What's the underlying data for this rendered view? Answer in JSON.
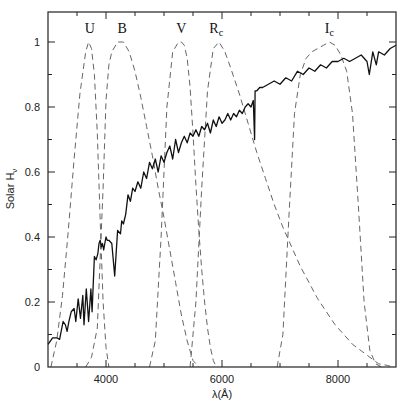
{
  "chart_data": {
    "type": "line",
    "title": "",
    "xlabel": "λ(Å)",
    "ylabel": "Solar H_ν",
    "xlim": [
      3000,
      9000
    ],
    "ylim": [
      0,
      1.1
    ],
    "grid": false,
    "legend": "none (bands labelled above peaks)",
    "x_ticks": [
      4000,
      6000,
      8000
    ],
    "x_minor_step": 500,
    "y_ticks": [
      0,
      0.2,
      0.4,
      0.6,
      0.8,
      1
    ],
    "y_tick_labels": [
      "0",
      "0.2",
      "0.4",
      "0.6",
      "0.8",
      "1"
    ],
    "y_minor_step": 0.1,
    "series": [
      {
        "name": "Solar H_ν",
        "style": "solid",
        "x": [
          3000,
          3080,
          3150,
          3200,
          3260,
          3300,
          3330,
          3360,
          3400,
          3450,
          3480,
          3520,
          3560,
          3600,
          3620,
          3660,
          3700,
          3740,
          3760,
          3800,
          3830,
          3860,
          3880,
          3900,
          3920,
          3940,
          3960,
          3980,
          4000,
          4020,
          4050,
          4100,
          4150,
          4200,
          4250,
          4270,
          4300,
          4340,
          4380,
          4420,
          4460,
          4500,
          4550,
          4600,
          4650,
          4700,
          4750,
          4800,
          4850,
          4900,
          4950,
          5000,
          5050,
          5100,
          5150,
          5200,
          5250,
          5300,
          5350,
          5400,
          5450,
          5500,
          5550,
          5600,
          5650,
          5700,
          5750,
          5800,
          5850,
          5900,
          5950,
          6000,
          6050,
          6100,
          6150,
          6200,
          6250,
          6300,
          6350,
          6400,
          6450,
          6500,
          6540,
          6562,
          6570,
          6600,
          6650,
          6700,
          6800,
          6900,
          7000,
          7100,
          7200,
          7300,
          7400,
          7500,
          7600,
          7700,
          7800,
          7900,
          8000,
          8100,
          8200,
          8300,
          8400,
          8500,
          8540,
          8600,
          8660,
          8700,
          8800,
          8900,
          9000
        ],
        "values": [
          0.07,
          0.09,
          0.09,
          0.085,
          0.14,
          0.13,
          0.11,
          0.14,
          0.17,
          0.18,
          0.14,
          0.21,
          0.15,
          0.22,
          0.13,
          0.24,
          0.14,
          0.24,
          0.17,
          0.34,
          0.33,
          0.35,
          0.38,
          0.39,
          0.37,
          0.38,
          0.36,
          0.38,
          0.4,
          0.39,
          0.39,
          0.38,
          0.28,
          0.42,
          0.41,
          0.45,
          0.44,
          0.47,
          0.53,
          0.51,
          0.55,
          0.54,
          0.57,
          0.55,
          0.6,
          0.58,
          0.63,
          0.61,
          0.64,
          0.6,
          0.65,
          0.63,
          0.66,
          0.68,
          0.64,
          0.7,
          0.66,
          0.69,
          0.71,
          0.69,
          0.72,
          0.71,
          0.73,
          0.71,
          0.74,
          0.73,
          0.75,
          0.72,
          0.76,
          0.74,
          0.77,
          0.75,
          0.76,
          0.78,
          0.76,
          0.78,
          0.77,
          0.79,
          0.78,
          0.8,
          0.81,
          0.8,
          0.82,
          0.7,
          0.85,
          0.85,
          0.86,
          0.86,
          0.87,
          0.88,
          0.87,
          0.89,
          0.88,
          0.91,
          0.9,
          0.92,
          0.91,
          0.93,
          0.92,
          0.94,
          0.94,
          0.95,
          0.94,
          0.95,
          0.96,
          0.94,
          0.9,
          0.97,
          0.93,
          0.97,
          0.96,
          0.98,
          0.99
        ]
      },
      {
        "name": "U",
        "style": "dashed",
        "x": [
          3050,
          3150,
          3250,
          3350,
          3450,
          3550,
          3650,
          3700,
          3750,
          3800,
          3850,
          3900,
          3950,
          4000,
          4050
        ],
        "values": [
          0.0,
          0.08,
          0.22,
          0.42,
          0.64,
          0.84,
          0.97,
          1.0,
          0.98,
          0.9,
          0.72,
          0.45,
          0.2,
          0.06,
          0.0
        ]
      },
      {
        "name": "B",
        "style": "dashed",
        "x": [
          3650,
          3750,
          3850,
          3950,
          4000,
          4050,
          4100,
          4200,
          4300,
          4400,
          4500,
          4600,
          4700,
          4800,
          4900,
          5000,
          5100,
          5200,
          5300,
          5400,
          5500,
          5600
        ],
        "values": [
          0.0,
          0.03,
          0.12,
          0.55,
          0.82,
          0.93,
          0.97,
          1.0,
          1.0,
          0.97,
          0.91,
          0.83,
          0.74,
          0.65,
          0.55,
          0.46,
          0.36,
          0.26,
          0.16,
          0.08,
          0.02,
          0.0
        ]
      },
      {
        "name": "V",
        "style": "dashed",
        "x": [
          4750,
          4850,
          4950,
          5050,
          5150,
          5250,
          5300,
          5350,
          5400,
          5450,
          5500,
          5550,
          5600,
          5650,
          5700,
          5750,
          5800,
          5850,
          5900
        ],
        "values": [
          0.0,
          0.08,
          0.4,
          0.8,
          0.97,
          1.0,
          1.0,
          0.99,
          0.95,
          0.86,
          0.72,
          0.56,
          0.42,
          0.3,
          0.2,
          0.12,
          0.06,
          0.02,
          0.0
        ]
      },
      {
        "name": "Rc",
        "style": "dashed",
        "x": [
          5450,
          5550,
          5650,
          5750,
          5850,
          5950,
          6050,
          6150,
          6300,
          6450,
          6600,
          6750,
          6900,
          7050,
          7200,
          7350,
          7500,
          7650,
          7800,
          7950,
          8100,
          8250,
          8400,
          8550,
          8700,
          8850,
          8950
        ],
        "values": [
          0.0,
          0.2,
          0.55,
          0.85,
          0.98,
          1.0,
          0.97,
          0.92,
          0.84,
          0.75,
          0.66,
          0.58,
          0.5,
          0.43,
          0.37,
          0.31,
          0.26,
          0.21,
          0.17,
          0.13,
          0.1,
          0.07,
          0.05,
          0.03,
          0.01,
          0.005,
          0.0
        ]
      },
      {
        "name": "Ic",
        "style": "dashed",
        "x": [
          6950,
          7050,
          7150,
          7250,
          7350,
          7450,
          7550,
          7650,
          7750,
          7850,
          7950,
          8050,
          8150,
          8250,
          8350,
          8450,
          8550,
          8650,
          8750
        ],
        "values": [
          0.0,
          0.1,
          0.45,
          0.78,
          0.9,
          0.95,
          0.97,
          0.98,
          0.99,
          1.0,
          0.99,
          0.96,
          0.91,
          0.78,
          0.5,
          0.2,
          0.05,
          0.01,
          0.0
        ]
      }
    ],
    "annotations": [
      {
        "text": "U",
        "x": 3720,
        "y": 1.04
      },
      {
        "text": "B",
        "x": 4280,
        "y": 1.04
      },
      {
        "text": "V",
        "x": 5300,
        "y": 1.04
      },
      {
        "text": "R",
        "sub": "c",
        "x": 5900,
        "y": 1.04
      },
      {
        "text": "I",
        "sub": "c",
        "x": 7850,
        "y": 1.04
      }
    ]
  },
  "axes": {
    "x_label": "λ(Å)",
    "y_label_main": "Solar H",
    "y_label_sub": "ν"
  }
}
